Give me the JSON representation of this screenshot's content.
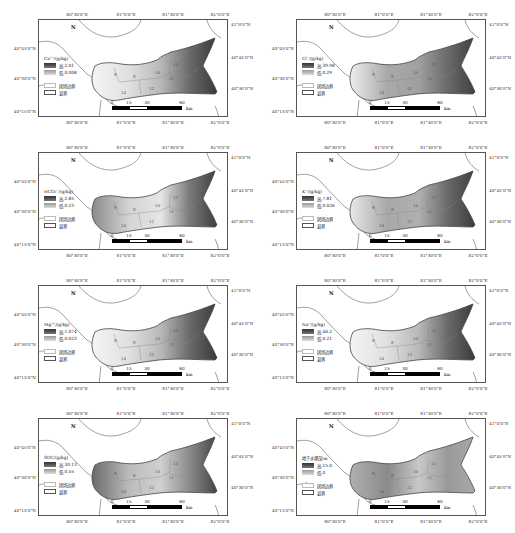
{
  "common": {
    "lon_ticks": [
      "80°30'0\"E",
      "81°0'0\"E",
      "81°30'0\"E",
      "82°0'0\"E"
    ],
    "lat_ticks_left": [
      "40°45'0\"N",
      "40°30'0\"N",
      "40°15'0\"N"
    ],
    "lat_ticks_right": [
      "41°0'0\"N",
      "40°45'0\"N",
      "40°30'0\"N"
    ],
    "legend_high_prefix": "高: ",
    "legend_low_prefix": "低: ",
    "legend_boundary_label": "团场边界",
    "legend_county_label": "县界",
    "north_label": "N",
    "scale": {
      "labels": [
        "0",
        "15",
        "30",
        "60"
      ],
      "unit": "km"
    },
    "region_labels": [
      "9",
      "10",
      "11",
      "12",
      "13",
      "14",
      "8"
    ]
  },
  "panels": [
    {
      "id": "ca",
      "title": "Ca²⁺/(g/kg)",
      "high": "2.01",
      "low": "0.008",
      "shading": "east-dark-gradient"
    },
    {
      "id": "cl",
      "title": "Cl⁻/(g/kg)",
      "high": "39.98",
      "low": "0.29",
      "shading": "central-gray-east-dark"
    },
    {
      "id": "hco3",
      "title": "HCO₃⁻/(g/kg)",
      "high": "2.85",
      "low": "0.23",
      "shading": "west-and-southeast-dark"
    },
    {
      "id": "k",
      "title": "K⁺/(g/kg)",
      "high": "7.81",
      "low": "0.026",
      "shading": "central-gray-southeast-dark"
    },
    {
      "id": "mg",
      "title": "Mg²⁺/(g/kg)",
      "high": "1.074",
      "low": "0.023",
      "shading": "east-dark-gradient"
    },
    {
      "id": "na",
      "title": "Na⁺/(g/kg)",
      "high": "46.2",
      "low": "0.21",
      "shading": "east-dark-gradient"
    },
    {
      "id": "soc",
      "title": "SOC/(g/kg)",
      "high": "30.13",
      "low": "0.55",
      "shading": "patchy-southeast-dark"
    },
    {
      "id": "gw",
      "title": "地下水埋深/m",
      "high": "15.0",
      "low": "0",
      "shading": "mottled"
    }
  ],
  "chart_data": {
    "type": "heatmap",
    "maps": [
      {
        "variable": "Ca2+",
        "unit": "g/kg",
        "max": 2.01,
        "min": 0.008
      },
      {
        "variable": "Cl-",
        "unit": "g/kg",
        "max": 39.98,
        "min": 0.29
      },
      {
        "variable": "HCO3-",
        "unit": "g/kg",
        "max": 2.85,
        "min": 0.23
      },
      {
        "variable": "K+",
        "unit": "g/kg",
        "max": 7.81,
        "min": 0.026
      },
      {
        "variable": "Mg2+",
        "unit": "g/kg",
        "max": 1.074,
        "min": 0.023
      },
      {
        "variable": "Na+",
        "unit": "g/kg",
        "max": 46.2,
        "min": 0.21
      },
      {
        "variable": "SOC",
        "unit": "g/kg",
        "max": 30.13,
        "min": 0.55
      },
      {
        "variable": "地下水埋深",
        "unit": "m",
        "max": 15.0,
        "min": 0
      }
    ],
    "xlabel": "Longitude",
    "ylabel": "Latitude",
    "x_ticks": [
      "80°30'0\"E",
      "81°0'0\"E",
      "81°30'0\"E",
      "82°0'0\"E"
    ],
    "y_ticks": [
      "40°15'0\"N",
      "40°30'0\"N",
      "40°45'0\"N",
      "41°0'0\"N"
    ],
    "scale_bar_km": [
      0,
      15,
      30,
      60
    ]
  }
}
